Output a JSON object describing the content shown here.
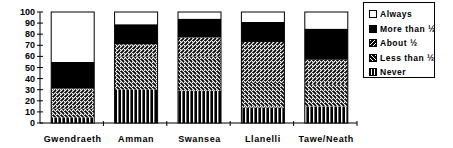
{
  "chart_data": {
    "type": "bar",
    "stacked": true,
    "title": "",
    "xlabel": "",
    "ylabel": "",
    "ylim": [
      0,
      100
    ],
    "yticks": [
      0,
      10,
      20,
      30,
      40,
      50,
      60,
      70,
      80,
      90,
      100
    ],
    "grid": false,
    "legend_position": "right",
    "categories": [
      "Gwendraeth",
      "Amman",
      "Swansea",
      "Llanelli",
      "Tawe/Neath"
    ],
    "series": [
      {
        "name": "Never",
        "pattern": "vertical-stripes",
        "values": [
          5,
          30,
          29,
          14,
          15
        ]
      },
      {
        "name": "Less than ½",
        "pattern": "back-diagonal-hatch",
        "values": [
          8,
          30,
          31,
          22,
          20
        ]
      },
      {
        "name": "About ½",
        "pattern": "forward-diagonal-hatch",
        "values": [
          18,
          11,
          17,
          37,
          22
        ]
      },
      {
        "name": "More than ½",
        "pattern": "solid-black",
        "values": [
          24,
          18,
          17,
          18,
          28
        ]
      },
      {
        "name": "Always",
        "pattern": "white",
        "values": [
          45,
          11,
          6,
          9,
          15
        ]
      }
    ]
  },
  "legend": {
    "items": [
      {
        "label": "Always",
        "icon": "white-square"
      },
      {
        "label": "More than ½",
        "icon": "black-square"
      },
      {
        "label": "About ½",
        "icon": "forward-hatch-square"
      },
      {
        "label": "Less than ½",
        "icon": "back-hatch-square"
      },
      {
        "label": "Never",
        "icon": "vertical-stripe-square"
      }
    ]
  }
}
